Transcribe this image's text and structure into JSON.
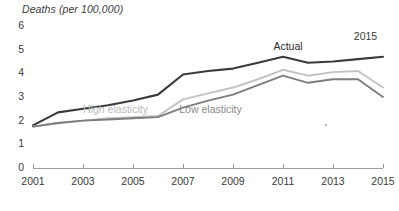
{
  "chart_data": {
    "type": "line",
    "title": "Deaths (per 100,000)",
    "xlabel": "",
    "ylabel": "Deaths (per 100,000)",
    "x": [
      2001,
      2002,
      2003,
      2004,
      2005,
      2006,
      2007,
      2008,
      2009,
      2010,
      2011,
      2012,
      2013,
      2014,
      2015
    ],
    "xlim": [
      2001,
      2015
    ],
    "ylim": [
      0,
      6
    ],
    "yticks": [
      0,
      1,
      2,
      3,
      4,
      5,
      6
    ],
    "xticks": [
      2001,
      2003,
      2005,
      2007,
      2009,
      2011,
      2013,
      2015
    ],
    "xtick_labels": [
      "2001",
      "2003",
      "2005",
      "2007",
      "2009",
      "2011",
      "2013",
      "2015"
    ],
    "ytick_labels": [
      "0",
      "1",
      "2",
      "3",
      "4",
      "5",
      "6"
    ],
    "grid": false,
    "legend": "inline-labels",
    "series": [
      {
        "name": "Actual",
        "color": "#3a3a3a",
        "label_x": 2011.2,
        "label_y": 5.1,
        "values": [
          1.8,
          2.35,
          2.5,
          2.65,
          2.85,
          3.1,
          3.95,
          4.1,
          4.2,
          4.45,
          4.7,
          4.45,
          4.5,
          4.6,
          4.7
        ]
      },
      {
        "name": "High elasticity",
        "color": "#c2c2c2",
        "label_x": 2004.3,
        "label_y": 2.45,
        "values": [
          1.75,
          1.9,
          2.0,
          2.1,
          2.15,
          2.2,
          2.9,
          3.15,
          3.4,
          3.75,
          4.15,
          3.9,
          4.05,
          4.1,
          3.4
        ]
      },
      {
        "name": "Low elasticity",
        "color": "#7d7d7d",
        "label_x": 2008.1,
        "label_y": 2.45,
        "values": [
          1.75,
          1.9,
          2.0,
          2.05,
          2.1,
          2.15,
          2.55,
          2.85,
          3.1,
          3.5,
          3.9,
          3.6,
          3.75,
          3.75,
          3.0
        ]
      }
    ],
    "annotations": [
      {
        "text": "2015",
        "x": 2014.3,
        "y": 5.55
      }
    ],
    "colors": {
      "actual": "#3a3a3a",
      "high_elasticity": "#c2c2c2",
      "low_elasticity": "#7d7d7d",
      "axis": "#9c9c9c",
      "text": "#3a3a3a",
      "background": "#ffffff"
    }
  }
}
